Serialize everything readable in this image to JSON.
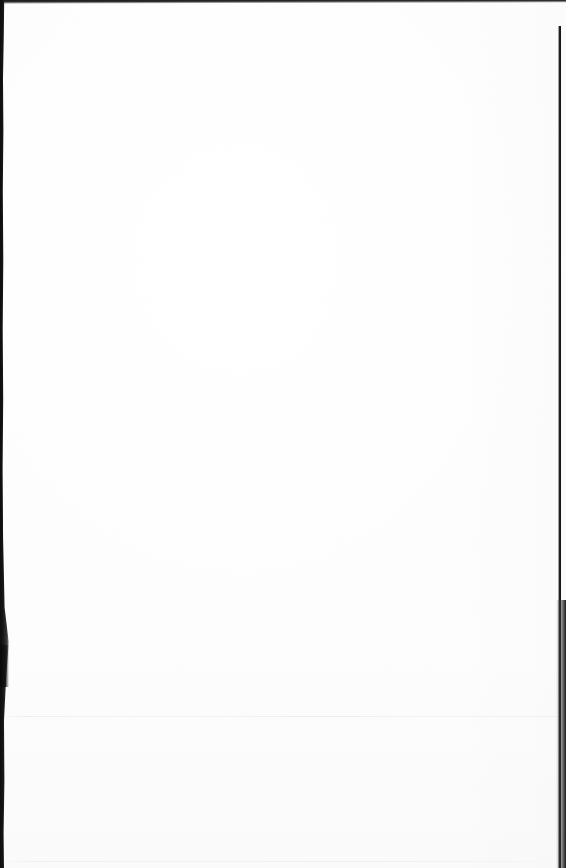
{
  "document": {
    "kind": "scanned-page",
    "page_state": "blank",
    "visible_text": "",
    "text_blocks": [],
    "headings": [],
    "paragraphs": [],
    "figures": [],
    "tables": [],
    "page_number": "",
    "header_text": "",
    "footer_text": ""
  },
  "artifacts": {
    "top_edge": {
      "name": "top-scan-edge",
      "color": "#1a1a1a"
    },
    "left_edge": {
      "name": "left-scan-edge",
      "color": "#0d0d0d"
    },
    "right_edge": {
      "name": "right-scan-edge",
      "color": "#111111"
    },
    "rules": [
      {
        "name": "horizontal-rule-main",
        "color": "#f0f0f0"
      },
      {
        "name": "horizontal-rule-bottom",
        "color": "#f3f3f3"
      }
    ]
  },
  "colors": {
    "paper": "#ffffff",
    "paper_shade": "#fdfdfd",
    "edge_dark": "#111111",
    "rule_faint": "#f0f0f0"
  }
}
